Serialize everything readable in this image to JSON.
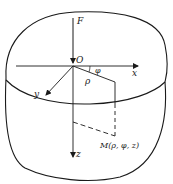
{
  "diagram": {
    "labels": {
      "force": "F",
      "origin": "O",
      "x_axis": "x",
      "y_axis": "y",
      "z_axis": "z",
      "rho": "ρ",
      "phi": "φ",
      "point": "M(ρ, φ, z)"
    },
    "colors": {
      "stroke": "#1a1a1a",
      "background": "#ffffff"
    }
  }
}
